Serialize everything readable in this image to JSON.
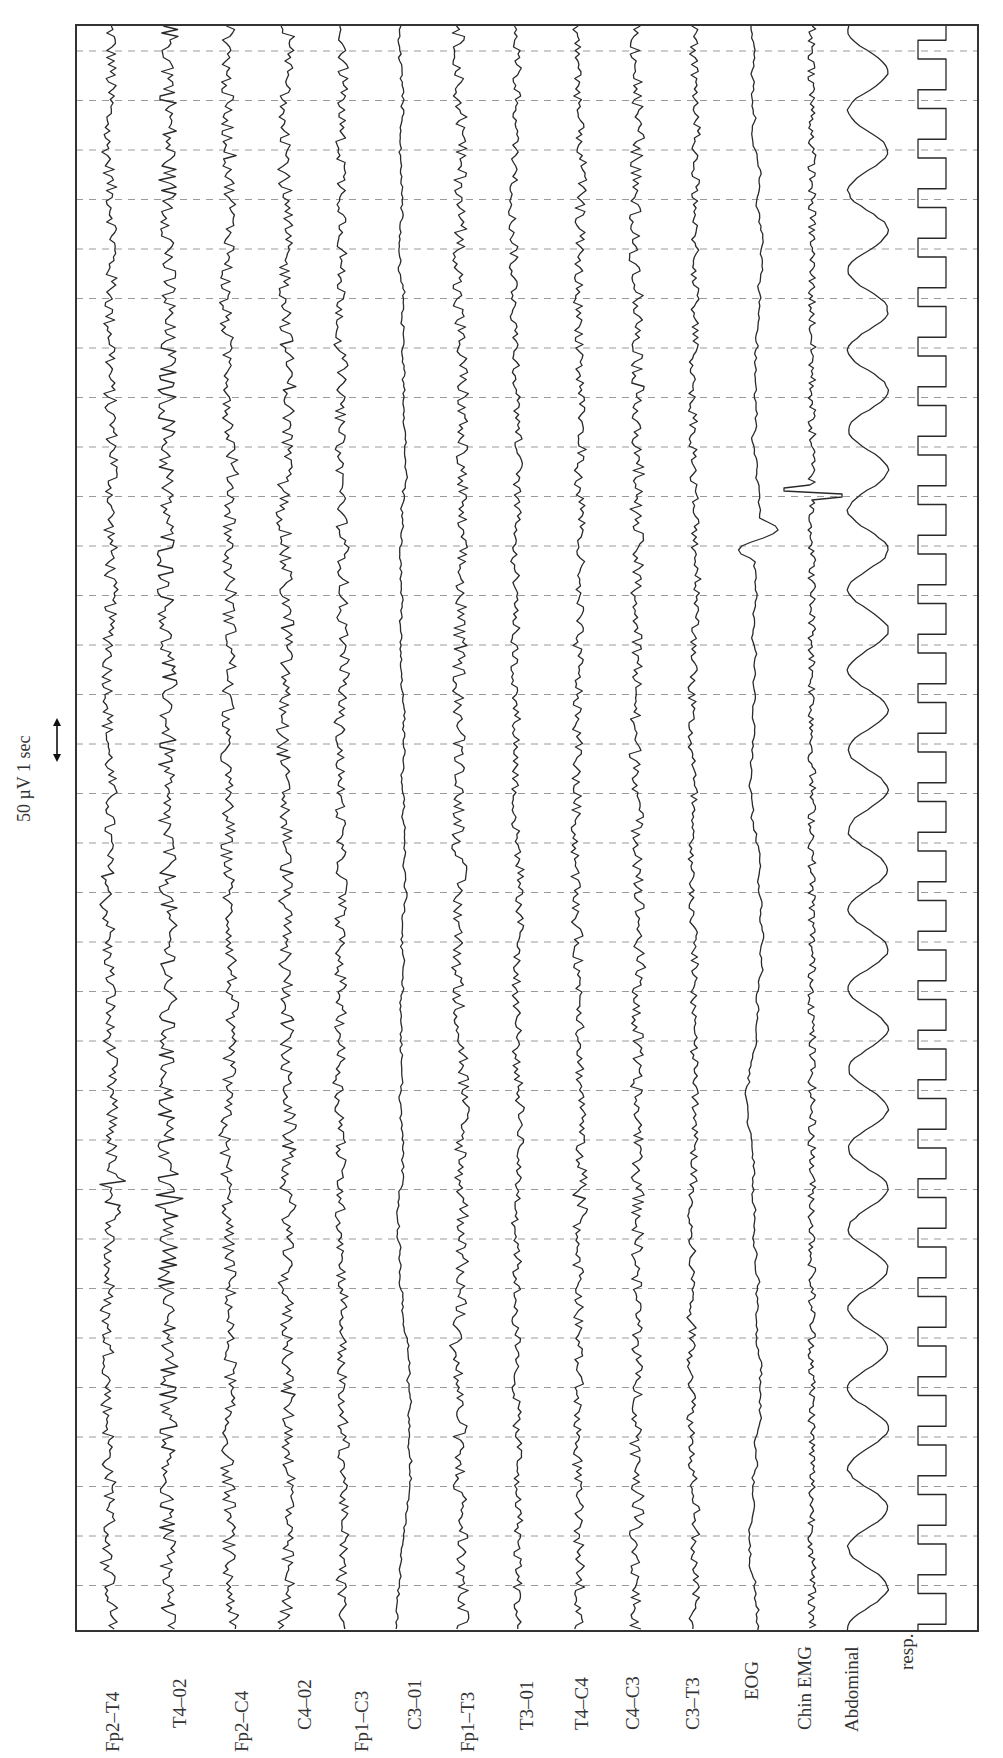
{
  "chart_data": {
    "type": "line",
    "title": "",
    "scale_bar": {
      "label": "50 µV 1 sec",
      "amplitude_uV": 50,
      "time_s": 1
    },
    "time_axis": {
      "direction": "top-to-bottom",
      "gridlines": "dashed, 1 s spacing",
      "grid_count": 32,
      "duration_s": 32
    },
    "channels": [
      {
        "name": "Fp2–T4",
        "x": 110,
        "amp": 7,
        "freq": 0.9,
        "style": "eeg"
      },
      {
        "name": "T4–02",
        "x": 168,
        "amp": 9,
        "freq": 1.0,
        "style": "eeg"
      },
      {
        "name": "Fp2–C4",
        "x": 228,
        "amp": 8,
        "freq": 0.8,
        "style": "eeg"
      },
      {
        "name": "C4–02",
        "x": 287,
        "amp": 8,
        "freq": 0.85,
        "style": "eeg"
      },
      {
        "name": "Fp1–C3",
        "x": 342,
        "amp": 6,
        "freq": 0.9,
        "style": "eeg"
      },
      {
        "name": "C3–01",
        "x": 403,
        "amp": 4,
        "freq": 0.5,
        "style": "eeg-slow"
      },
      {
        "name": "Fp1–T3",
        "x": 460,
        "amp": 7,
        "freq": 0.9,
        "style": "eeg"
      },
      {
        "name": "T3–01",
        "x": 517,
        "amp": 6,
        "freq": 0.7,
        "style": "eeg"
      },
      {
        "name": "T4–C4",
        "x": 578,
        "amp": 6,
        "freq": 0.8,
        "style": "eeg"
      },
      {
        "name": "C4–C3",
        "x": 637,
        "amp": 7,
        "freq": 0.9,
        "style": "eeg"
      },
      {
        "name": "C3–T3",
        "x": 694,
        "amp": 6,
        "freq": 0.7,
        "style": "eeg"
      },
      {
        "name": "EOG",
        "x": 755,
        "amp": 8,
        "freq": 0.35,
        "style": "eog"
      },
      {
        "name": "Chin EMG",
        "x": 812,
        "amp": 4,
        "freq": 2.2,
        "style": "emg"
      },
      {
        "name": "Abdominal",
        "x": 868,
        "amp": 20,
        "freq": 0.5,
        "style": "resp-sine"
      },
      {
        "name": "resp.",
        "x": 932,
        "amp": 14,
        "freq": 1.0,
        "style": "square"
      }
    ],
    "labels_visible": [
      "Fp2–T4",
      "T4–02",
      "Fp2–C4",
      "C4–02",
      "Fp1–C3",
      "C3–01",
      "Fp1–T3",
      "T3–01",
      "T4–C4",
      "C4–C3",
      "C3–T3",
      "EOG",
      "Chin EMG",
      "Abdominal",
      "resp."
    ],
    "frame": {
      "left": 76,
      "top": 25,
      "right": 978,
      "bottom": 1631
    },
    "grid": {
      "first_y": 51,
      "spacing": 49.5,
      "count": 32,
      "color": "#9a9a9a"
    },
    "trace_color": "#2a2a2a"
  }
}
